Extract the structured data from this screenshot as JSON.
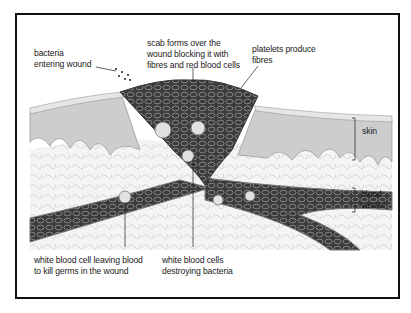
{
  "figure": {
    "labels": {
      "bacteria": "bacteria\nentering wound",
      "scab": "scab forms over the\nwound blocking it with\nfibres and red blood cells",
      "platelets": "platelets produce\nfibres",
      "skin": "skin",
      "blood_vessel": "blood\nvessel",
      "wbc_leaving": "white blood cell leaving blood\nto kill germs in the wound",
      "wbc_destroying": "white blood cells\ndestroying bacteria"
    },
    "colors": {
      "frame": "#111111",
      "skin_top": "#cfcfcf",
      "skin_dermis": "#efefef",
      "scab": "#3a3a3a",
      "vessel": "#5a5a5a",
      "text": "#1a1a1a"
    }
  }
}
